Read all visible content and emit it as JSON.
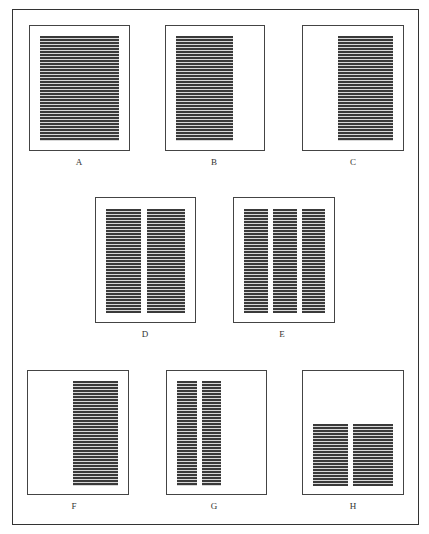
{
  "figure": {
    "panels": [
      {
        "id": "A",
        "label": "A",
        "box": [
          29,
          25,
          101,
          126
        ],
        "columns": [
          [
            40,
            36,
            79,
            105
          ]
        ]
      },
      {
        "id": "B",
        "label": "B",
        "box": [
          165,
          25,
          100,
          126
        ],
        "columns": [
          [
            176,
            36,
            57,
            105
          ]
        ]
      },
      {
        "id": "C",
        "label": "C",
        "box": [
          302,
          25,
          102,
          126
        ],
        "columns": [
          [
            338,
            36,
            55,
            105
          ]
        ]
      },
      {
        "id": "D",
        "label": "D",
        "box": [
          95,
          197,
          101,
          126
        ],
        "columns": [
          [
            106,
            209,
            35,
            104
          ],
          [
            147,
            209,
            38,
            104
          ]
        ]
      },
      {
        "id": "E",
        "label": "E",
        "box": [
          233,
          197,
          102,
          126
        ],
        "columns": [
          [
            244,
            209,
            24,
            104
          ],
          [
            273,
            209,
            24,
            104
          ],
          [
            302,
            209,
            23,
            104
          ]
        ]
      },
      {
        "id": "F",
        "label": "F",
        "box": [
          27,
          370,
          102,
          125
        ],
        "columns": [
          [
            73,
            381,
            45,
            105
          ]
        ]
      },
      {
        "id": "G",
        "label": "G",
        "box": [
          166,
          370,
          101,
          125
        ],
        "columns": [
          [
            177,
            381,
            20,
            105
          ],
          [
            202,
            381,
            19,
            105
          ]
        ]
      },
      {
        "id": "H",
        "label": "H",
        "box": [
          302,
          370,
          102,
          125
        ],
        "columns": [
          [
            313,
            424,
            35,
            62
          ],
          [
            353,
            424,
            40,
            62
          ]
        ]
      }
    ]
  }
}
